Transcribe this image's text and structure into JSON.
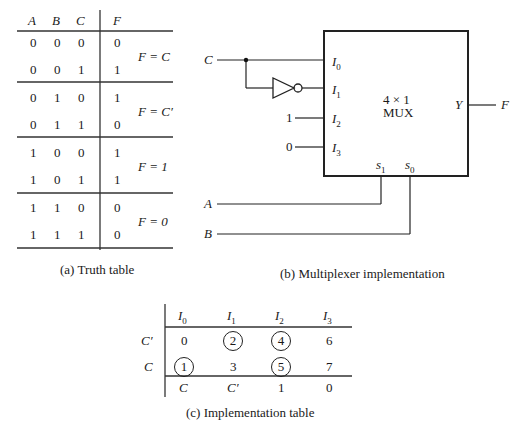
{
  "truth_table": {
    "headers": [
      "A",
      "B",
      "C",
      "F"
    ],
    "rows": [
      [
        "0",
        "0",
        "0",
        "0"
      ],
      [
        "0",
        "0",
        "1",
        "1"
      ],
      [
        "0",
        "1",
        "0",
        "1"
      ],
      [
        "0",
        "1",
        "1",
        "0"
      ],
      [
        "1",
        "0",
        "0",
        "1"
      ],
      [
        "1",
        "0",
        "1",
        "1"
      ],
      [
        "1",
        "1",
        "0",
        "0"
      ],
      [
        "1",
        "1",
        "1",
        "0"
      ]
    ],
    "groups": [
      "F = C",
      "F = C′",
      "F = 1",
      "F = 0"
    ],
    "caption": "(a)  Truth table"
  },
  "mux_diagram": {
    "input_c": "C",
    "const_1": "1",
    "const_0": "0",
    "pin_labels": [
      "I0",
      "I1",
      "I2",
      "I3"
    ],
    "pin_main": "I",
    "pin_subs": [
      "0",
      "1",
      "2",
      "3"
    ],
    "box_title": "4 × 1",
    "box_subtitle": "MUX",
    "output_pin": "Y",
    "output_label": "F",
    "select_main": "s",
    "select_subs": [
      "1",
      "0"
    ],
    "select_a": "A",
    "select_b": "B",
    "caption": "(b)  Multiplexer implementation"
  },
  "impl_table": {
    "columns": [
      "I0",
      "I1",
      "I2",
      "I3"
    ],
    "col_main": "I",
    "col_subs": [
      "0",
      "1",
      "2",
      "3"
    ],
    "row_labels": [
      "C′",
      "C"
    ],
    "rows": [
      [
        "0",
        "2",
        "4",
        "6"
      ],
      [
        "1",
        "3",
        "5",
        "7"
      ]
    ],
    "circled": [
      [
        false,
        true,
        true,
        false
      ],
      [
        true,
        false,
        true,
        false
      ]
    ],
    "result": [
      "C",
      "C′",
      "1",
      "0"
    ],
    "caption": "(c)  Implementation table"
  }
}
